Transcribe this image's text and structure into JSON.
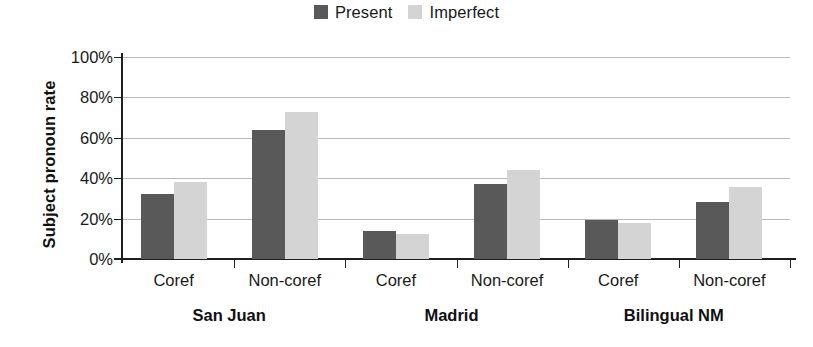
{
  "chart_data": {
    "type": "bar",
    "title": "",
    "xlabel": "",
    "ylabel": "Subject pronoun rate",
    "ylim": [
      0,
      100
    ],
    "ytick_labels": [
      "100%",
      "80%",
      "60%",
      "40%",
      "20%",
      "0%"
    ],
    "ytick_values": [
      100,
      80,
      60,
      40,
      20,
      0
    ],
    "grid": true,
    "legend_position": "top-center",
    "groups": [
      "San Juan",
      "Madrid",
      "Bilingual NM"
    ],
    "categories": [
      "Coref",
      "Non-coref",
      "Coref",
      "Non-coref",
      "Coref",
      "Non-coref"
    ],
    "series": [
      {
        "name": "Present",
        "color": "#595959",
        "values": [
          32,
          64,
          14,
          37,
          19.5,
          28
        ]
      },
      {
        "name": "Imperfect",
        "color": "#d4d4d4",
        "values": [
          38,
          73,
          12.5,
          44,
          18,
          35.5
        ]
      }
    ],
    "points": [
      {
        "group": "San Juan",
        "category": "Coref",
        "Present": 32,
        "Imperfect": 38
      },
      {
        "group": "San Juan",
        "category": "Non-coref",
        "Present": 64,
        "Imperfect": 73
      },
      {
        "group": "Madrid",
        "category": "Coref",
        "Present": 14,
        "Imperfect": 12.5
      },
      {
        "group": "Madrid",
        "category": "Non-coref",
        "Present": 37,
        "Imperfect": 44
      },
      {
        "group": "Bilingual NM",
        "category": "Coref",
        "Present": 19.5,
        "Imperfect": 18
      },
      {
        "group": "Bilingual NM",
        "category": "Non-coref",
        "Present": 28,
        "Imperfect": 35.5
      }
    ]
  },
  "legend": {
    "entries": [
      {
        "label": "Present",
        "color": "#595959"
      },
      {
        "label": "Imperfect",
        "color": "#d4d4d4"
      }
    ]
  },
  "axes": {
    "y_title": "Subject pronoun rate",
    "y_ticks": [
      "100%",
      "80%",
      "60%",
      "40%",
      "20%",
      "0%"
    ],
    "x_categories": [
      "Coref",
      "Non-coref",
      "Coref",
      "Non-coref",
      "Coref",
      "Non-coref"
    ],
    "x_groups": [
      "San Juan",
      "Madrid",
      "Bilingual NM"
    ]
  },
  "colors": {
    "present": "#595959",
    "imperfect": "#d4d4d4",
    "axis": "#1f1f1f",
    "grid": "#b9b9b9",
    "text": "#1a1a1a",
    "background": "#ffffff"
  }
}
